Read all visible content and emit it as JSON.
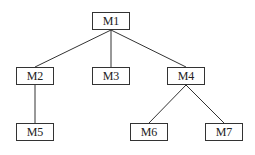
{
  "diagram": {
    "type": "tree",
    "nodes": [
      {
        "id": "M1",
        "label": "M1",
        "x": 92,
        "y": 12,
        "w": 38,
        "h": 18
      },
      {
        "id": "M2",
        "label": "M2",
        "x": 16,
        "y": 67,
        "w": 38,
        "h": 18
      },
      {
        "id": "M3",
        "label": "M3",
        "x": 92,
        "y": 67,
        "w": 38,
        "h": 18
      },
      {
        "id": "M4",
        "label": "M4",
        "x": 167,
        "y": 67,
        "w": 38,
        "h": 18
      },
      {
        "id": "M5",
        "label": "M5",
        "x": 16,
        "y": 123,
        "w": 38,
        "h": 18
      },
      {
        "id": "M6",
        "label": "M6",
        "x": 130,
        "y": 123,
        "w": 38,
        "h": 18
      },
      {
        "id": "M7",
        "label": "M7",
        "x": 205,
        "y": 123,
        "w": 38,
        "h": 18
      }
    ],
    "edges": [
      {
        "from": "M1",
        "to": "M2"
      },
      {
        "from": "M1",
        "to": "M3"
      },
      {
        "from": "M1",
        "to": "M4"
      },
      {
        "from": "M2",
        "to": "M5"
      },
      {
        "from": "M4",
        "to": "M6"
      },
      {
        "from": "M4",
        "to": "M7"
      }
    ],
    "colors": {
      "stroke": "#333333",
      "background": "#ffffff",
      "text": "#222222"
    }
  }
}
